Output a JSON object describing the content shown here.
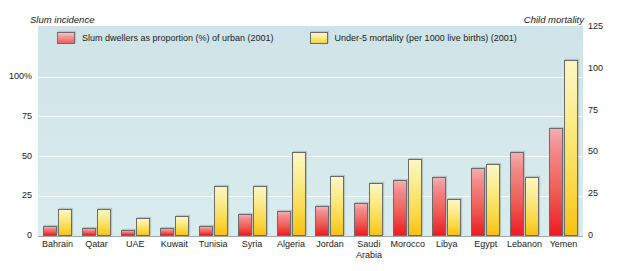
{
  "captions": {
    "left": "Slum incidence",
    "right": "Child mortality"
  },
  "legend": {
    "slum_label": "Slum dwellers as proportion (%) of urban (2001)",
    "mortality_label": "Under-5 mortality (per 1000 live births) (2001)",
    "slum_color": "#ed1c24",
    "mortality_color": "#f9c112"
  },
  "axes": {
    "left_ticks": [
      "100%",
      "75",
      "50",
      "25",
      "0"
    ],
    "right_ticks": [
      "125",
      "100",
      "75",
      "50",
      "25",
      "0"
    ]
  },
  "chart_data": {
    "type": "bar",
    "title": "",
    "xlabel": "",
    "ylabel": "Slum incidence",
    "y2label": "Child mortality",
    "ylim": [
      0,
      100
    ],
    "y2lim": [
      0,
      125
    ],
    "grid": true,
    "legend_position": "top-left",
    "categories": [
      "Bahrain",
      "Qatar",
      "UAE",
      "Kuwait",
      "Tunisia",
      "Syria",
      "Algeria",
      "Jordan",
      "Saudi Arabia",
      "Morocco",
      "Libya",
      "Egypt",
      "Lebanon",
      "Yemen"
    ],
    "series": [
      {
        "name": "Slum dwellers as proportion (%) of urban (2001)",
        "axis": "left",
        "unit": "%",
        "color": "#ed1c24",
        "values": [
          6,
          5,
          4,
          5,
          6,
          14,
          16,
          19,
          21,
          35,
          37,
          43,
          53,
          68
        ]
      },
      {
        "name": "Under-5 mortality (per 1000 live births) (2001)",
        "axis": "right",
        "unit": "per 1000 live births",
        "color": "#f9c112",
        "values": [
          16,
          16,
          11,
          12,
          30,
          30,
          50,
          36,
          32,
          46,
          22,
          43,
          35,
          105
        ]
      }
    ]
  }
}
